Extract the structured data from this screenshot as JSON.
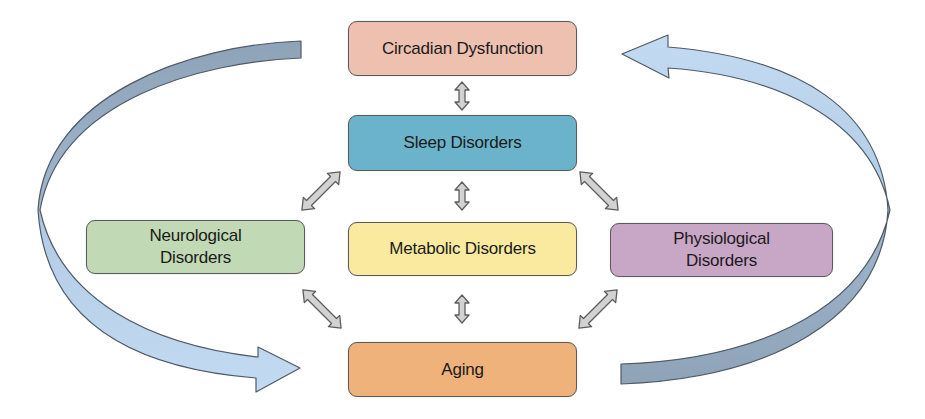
{
  "diagram": {
    "nodes": {
      "circadian": {
        "label": "Circadian Dysfunction",
        "color": "#eec0b0"
      },
      "sleep": {
        "label": "Sleep Disorders",
        "color": "#6bb3cb"
      },
      "neurological": {
        "label_line1": "Neurological",
        "label_line2": "Disorders",
        "color": "#c2d9b5"
      },
      "metabolic": {
        "label": "Metabolic Disorders",
        "color": "#faeaa0"
      },
      "physiological": {
        "label_line1": "Physiological",
        "label_line2": "Disorders",
        "color": "#c8a6c6"
      },
      "aging": {
        "label": "Aging",
        "color": "#eeb27a"
      }
    },
    "connectors": [
      {
        "from": "Circadian Dysfunction",
        "to": "Sleep Disorders",
        "type": "bidirectional"
      },
      {
        "from": "Sleep Disorders",
        "to": "Metabolic Disorders",
        "type": "bidirectional"
      },
      {
        "from": "Sleep Disorders",
        "to": "Neurological Disorders",
        "type": "bidirectional"
      },
      {
        "from": "Sleep Disorders",
        "to": "Physiological Disorders",
        "type": "bidirectional"
      },
      {
        "from": "Metabolic Disorders",
        "to": "Aging",
        "type": "bidirectional"
      },
      {
        "from": "Neurological Disorders",
        "to": "Aging",
        "type": "bidirectional"
      },
      {
        "from": "Physiological Disorders",
        "to": "Aging",
        "type": "bidirectional"
      },
      {
        "from": "Circadian Dysfunction",
        "to": "Aging",
        "type": "curved-left"
      },
      {
        "from": "Aging",
        "to": "Circadian Dysfunction",
        "type": "curved-right"
      }
    ],
    "colors": {
      "connector_fill": "#d2d2d2",
      "connector_stroke": "#5e5e5e",
      "curve_dark": "#8fa3b8",
      "curve_light": "#bcd6ee",
      "border": "#5a5a5a"
    }
  }
}
